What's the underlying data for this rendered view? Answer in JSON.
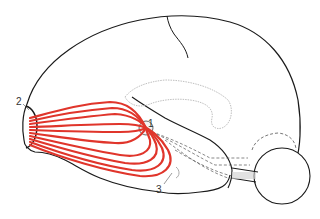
{
  "diagram": {
    "labels": [
      {
        "id": "1",
        "text": "1"
      },
      {
        "id": "2",
        "text": "2"
      },
      {
        "id": "3",
        "text": "3"
      }
    ],
    "colors": {
      "outline": "#1a1a1a",
      "fibers": "#e0352b",
      "faint_structures": "#b8b8b8",
      "dashed_paths": "#555555",
      "background": "#ffffff"
    },
    "elements": [
      "hemisphere-outline",
      "central-sulcus",
      "lateral-sulcus",
      "fiber-bundle",
      "frontal-pole-region",
      "cerebellum",
      "brainstem",
      "dashed-projections",
      "ventricle-outline"
    ]
  }
}
